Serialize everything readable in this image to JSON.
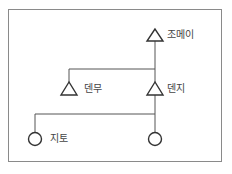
{
  "diagram": {
    "type": "kinship-tree",
    "nodes": [
      {
        "id": "jomei",
        "symbol": "triangle",
        "label": "조메이"
      },
      {
        "id": "tenmu",
        "symbol": "triangle",
        "label": "덴무"
      },
      {
        "id": "tenji",
        "symbol": "triangle",
        "label": "덴지"
      },
      {
        "id": "jito",
        "symbol": "circle",
        "label": "지토"
      },
      {
        "id": "unnamed",
        "symbol": "circle",
        "label": ""
      }
    ],
    "edges": [
      {
        "from": "jomei",
        "to": "tenmu"
      },
      {
        "from": "jomei",
        "to": "tenji"
      },
      {
        "from": "tenji",
        "to": "jito"
      },
      {
        "from": "tenji",
        "to": "unnamed"
      }
    ]
  }
}
